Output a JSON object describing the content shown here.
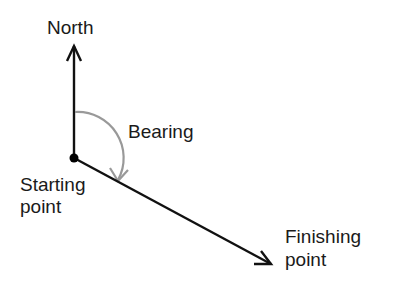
{
  "labels": {
    "north": "North",
    "bearing": "Bearing",
    "starting_line1": "Starting",
    "starting_line2": "point",
    "finishing_line1": "Finishing",
    "finishing_line2": "point"
  },
  "colors": {
    "line": "#111111",
    "arc": "#999999",
    "text": "#1a1a1a"
  }
}
